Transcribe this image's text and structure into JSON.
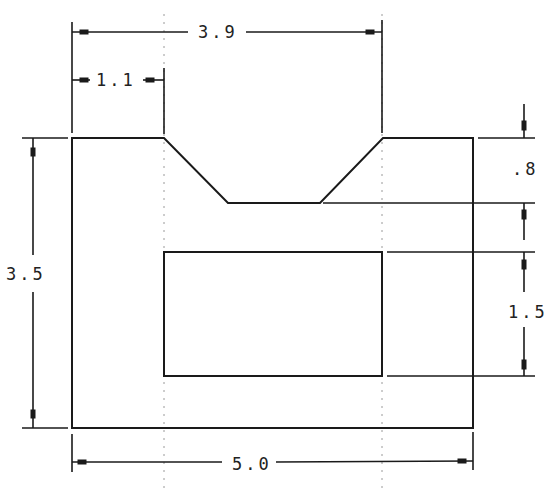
{
  "drawing": {
    "type": "orthographic-part-drawing",
    "units": "",
    "dimensions": {
      "overall_width": "5.0",
      "overall_height": "3.5",
      "notch_top_span": "3.9",
      "left_offset": "1.1",
      "notch_depth": ".8",
      "inner_cutout_height": "1.5"
    },
    "colors": {
      "line": "#1a1a1a",
      "centerline": "#9a9a9a",
      "background": "#ffffff"
    }
  }
}
